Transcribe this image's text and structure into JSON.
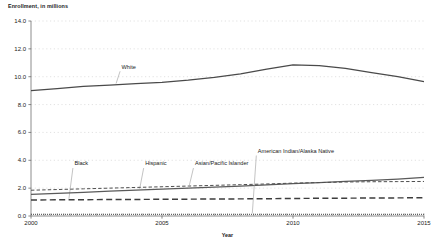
{
  "chart_data": {
    "type": "line",
    "title": "",
    "ylabel": "Enrollment, in millions",
    "xlabel": "Year",
    "ylim": [
      0.0,
      14.0
    ],
    "xlim": [
      2000,
      2015
    ],
    "grid": true,
    "legend_position": "inline-annotations",
    "ytick_labels": [
      "0.0",
      "2.0",
      "4.0",
      "6.0",
      "8.0",
      "10.0",
      "12.0",
      "14.0"
    ],
    "ytick_values": [
      0.0,
      2.0,
      4.0,
      6.0,
      8.0,
      10.0,
      12.0,
      14.0
    ],
    "xtick_labels": [
      "2000",
      "2005",
      "2010",
      "2015"
    ],
    "xtick_values": [
      2000,
      2005,
      2010,
      2015
    ],
    "x": [
      2000,
      2001,
      2002,
      2003,
      2004,
      2005,
      2006,
      2007,
      2008,
      2009,
      2010,
      2011,
      2012,
      2013,
      2014,
      2015
    ],
    "series": [
      {
        "name": "White",
        "style": "solid",
        "color": "#4a4a4a",
        "label_x": 2003.4,
        "label_y": 10.55,
        "values": [
          9.0,
          9.15,
          9.3,
          9.4,
          9.5,
          9.6,
          9.75,
          9.95,
          10.2,
          10.55,
          10.85,
          10.8,
          10.6,
          10.3,
          10.0,
          9.65
        ]
      },
      {
        "name": "Black",
        "style": "dashed-long",
        "color": "#3d3d3d",
        "label_x": 2001.6,
        "label_y": 3.6,
        "values": [
          1.15,
          1.16,
          1.17,
          1.18,
          1.19,
          1.2,
          1.21,
          1.22,
          1.23,
          1.24,
          1.26,
          1.27,
          1.28,
          1.29,
          1.3,
          1.31
        ]
      },
      {
        "name": "Hispanic",
        "style": "solid",
        "color": "#5a5a5a",
        "label_x": 2004.3,
        "label_y": 3.6,
        "values": [
          1.55,
          1.62,
          1.7,
          1.78,
          1.86,
          1.93,
          2.0,
          2.08,
          2.15,
          2.23,
          2.32,
          2.4,
          2.48,
          2.56,
          2.65,
          2.78
        ]
      },
      {
        "name": "Asian/Pacific Islander",
        "style": "dashed-short",
        "color": "#4f4f4f",
        "label_x": 2006.2,
        "label_y": 3.6,
        "values": [
          1.85,
          1.9,
          1.95,
          2.0,
          2.05,
          2.1,
          2.15,
          2.2,
          2.25,
          2.3,
          2.36,
          2.4,
          2.44,
          2.46,
          2.47,
          2.48
        ]
      },
      {
        "name": "American Indian/Alaska Native",
        "style": "dotted",
        "color": "#555555",
        "label_x": 2008.6,
        "label_y": 4.5,
        "values": [
          0.12,
          0.12,
          0.12,
          0.12,
          0.12,
          0.12,
          0.12,
          0.12,
          0.12,
          0.12,
          0.12,
          0.12,
          0.12,
          0.12,
          0.12,
          0.12
        ]
      }
    ]
  }
}
